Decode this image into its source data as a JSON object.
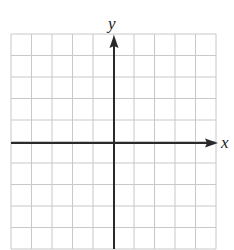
{
  "diagram": {
    "type": "coordinate-plane",
    "x_axis_label": "x",
    "y_axis_label": "y",
    "grid": {
      "columns": 10,
      "rows": 10,
      "color": "#c8c8c8"
    },
    "axis_color": "#2a2a2a",
    "top_text_cropped": true
  }
}
